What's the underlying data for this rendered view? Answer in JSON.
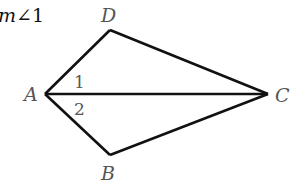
{
  "caption": {
    "prefix": "m",
    "angle_symbol": "∠",
    "suffix": "1"
  },
  "colors": {
    "stroke": "#111111",
    "label": "#555555"
  },
  "vertices": {
    "A": {
      "label": "A",
      "x": 45,
      "y": 94
    },
    "D": {
      "label": "D",
      "x": 110,
      "y": 30
    },
    "C": {
      "label": "C",
      "x": 268,
      "y": 94
    },
    "B": {
      "label": "B",
      "x": 110,
      "y": 155
    }
  },
  "angles": [
    {
      "label": "1",
      "between": [
        "AD",
        "AC"
      ]
    },
    {
      "label": "2",
      "between": [
        "AC",
        "AB"
      ]
    }
  ],
  "segments": [
    "AD",
    "DC",
    "AC",
    "AB",
    "BC"
  ]
}
